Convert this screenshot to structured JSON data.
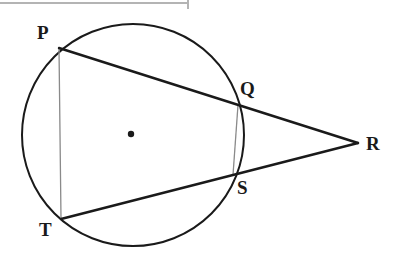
{
  "figure": {
    "type": "circle-geometry-diagram",
    "background_color": "#ffffff",
    "stroke_color": "#1a1a1a",
    "thin_stroke_color": "#8a8a8a",
    "canvas": {
      "width": 402,
      "height": 261
    },
    "top_rule": {
      "name": "page-edge-rule",
      "x1": 0,
      "y1": 3,
      "x2": 188,
      "y2": 3,
      "tick_x": 188,
      "tick_y1": 0,
      "tick_y2": 9,
      "color": "#b4b4b4"
    },
    "circle": {
      "center_x": 133,
      "center_y": 135,
      "radius": 111,
      "stroke_width": 2.0
    },
    "center_dot": {
      "x": 131,
      "y": 134,
      "radius": 3.2
    },
    "points": {
      "P": {
        "x": 59,
        "y": 48
      },
      "Q": {
        "x": 238,
        "y": 105
      },
      "R": {
        "x": 358,
        "y": 143
      },
      "S": {
        "x": 233,
        "y": 175
      },
      "T": {
        "x": 61,
        "y": 219
      }
    },
    "labels": [
      {
        "id": "P",
        "text": "P",
        "x": 37,
        "y": 23,
        "font_size": 19
      },
      {
        "id": "Q",
        "text": "Q",
        "x": 240,
        "y": 79,
        "font_size": 19
      },
      {
        "id": "R",
        "text": "R",
        "x": 366,
        "y": 134,
        "font_size": 19
      },
      {
        "id": "S",
        "text": "S",
        "x": 237,
        "y": 178,
        "font_size": 19
      },
      {
        "id": "T",
        "text": "T",
        "x": 39,
        "y": 220,
        "font_size": 19
      }
    ],
    "segments": [
      {
        "id": "PR",
        "name": "secant-p-to-r",
        "from": "P",
        "to": "R",
        "stroke_width": 2.4,
        "color": "#1a1a1a"
      },
      {
        "id": "TR",
        "name": "secant-t-to-r",
        "from": "T",
        "to": "R",
        "stroke_width": 2.4,
        "color": "#1a1a1a"
      },
      {
        "id": "PT",
        "name": "chord-p-to-t",
        "from": "P",
        "to": "T",
        "stroke_width": 1.3,
        "color": "#8a8a8a"
      },
      {
        "id": "QS",
        "name": "chord-q-to-s",
        "from": "Q",
        "to": "S",
        "stroke_width": 1.3,
        "color": "#8a8a8a"
      }
    ]
  }
}
